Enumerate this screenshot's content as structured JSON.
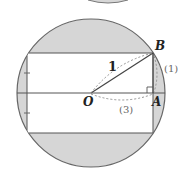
{
  "diagram": {
    "labels": {
      "B": "B",
      "O": "O",
      "A": "A",
      "radius": "1",
      "arc_B": "(1)",
      "arc_OA": "(3)"
    },
    "colors": {
      "shade": "#d6d6d6",
      "stroke": "#555555",
      "dashed": "#888888"
    }
  }
}
